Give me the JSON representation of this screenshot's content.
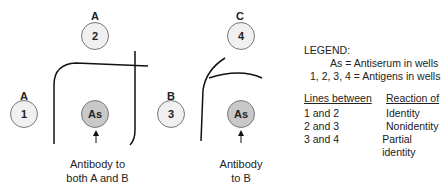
{
  "left_panel": {
    "wells": [
      {
        "label": "A",
        "number": "1"
      },
      {
        "label": "A",
        "number": "2"
      },
      {
        "center": "As"
      }
    ],
    "note_line1": "Antibody to",
    "note_line2": "both A and B"
  },
  "right_panel": {
    "wells": [
      {
        "label": "B",
        "number": "3"
      },
      {
        "label": "C",
        "number": "4"
      },
      {
        "center": "As"
      }
    ],
    "note_line1": "Antibody",
    "note_line2": "to B"
  },
  "legend": {
    "title": "LEGEND:",
    "line1": "As = Antiserum in wells",
    "line2": "1, 2, 3, 4 = Antigens in wells",
    "col1_header": "Lines between",
    "col2_header": "Reaction of",
    "rows": [
      {
        "lines": "1 and 2",
        "reaction": "Identity"
      },
      {
        "lines": "2 and 3",
        "reaction": "Nonidentity"
      },
      {
        "lines": "3 and 4",
        "reaction": "Partial identity"
      }
    ]
  }
}
